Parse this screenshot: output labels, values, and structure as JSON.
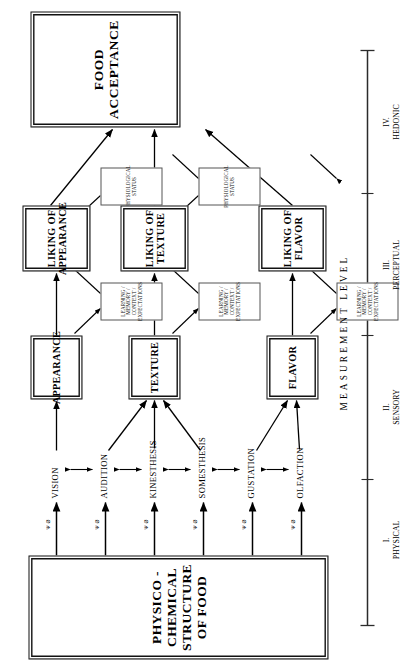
{
  "figure": {
    "source_box": {
      "lines": [
        "PHYSICO -",
        "CHEMICAL",
        "STRUCTURE",
        "OF FOOD"
      ],
      "text": "PHYSICO - CHEMICAL STRUCTURE OF FOOD"
    },
    "acceptance_box": {
      "lines": [
        "FOOD",
        "ACCEPTANCE"
      ],
      "text": "FOOD ACCEPTANCE"
    },
    "senses": [
      {
        "id": "vision",
        "label": "VISION"
      },
      {
        "id": "audition",
        "label": "AUDITION"
      },
      {
        "id": "kinesthesis",
        "label": "KINESTHESIS"
      },
      {
        "id": "somesthesis",
        "label": "SOMESTHESIS"
      },
      {
        "id": "gustation",
        "label": "GUSTATION"
      },
      {
        "id": "olfaction",
        "label": "OLFACTION"
      }
    ],
    "transduction_symbols": [
      {
        "id": "vision-symbol",
        "text": "Ψ Ø"
      },
      {
        "id": "audition-symbol",
        "text": "Ψ Ø"
      },
      {
        "id": "kinesthesis-symbol",
        "text": "Ψ Ø"
      },
      {
        "id": "somesthesis-symbol",
        "text": "Ψ Ø"
      },
      {
        "id": "gustation-symbol",
        "text": "Ψ Ø"
      },
      {
        "id": "olfaction-symbol",
        "text": "Ψ Ø"
      }
    ],
    "perceptual_boxes": [
      {
        "id": "appearance",
        "label": "APPEARANCE"
      },
      {
        "id": "texture",
        "label": "TEXTURE"
      },
      {
        "id": "flavor",
        "label": "FLAVOR"
      }
    ],
    "hedonic_boxes": [
      {
        "id": "liking-appearance",
        "lines": [
          "LIKING OF",
          "APPEARANCE"
        ],
        "text": "LIKING OF APPEARANCE"
      },
      {
        "id": "liking-texture",
        "lines": [
          "LIKING OF",
          "TEXTURE"
        ],
        "text": "LIKING OF TEXTURE"
      },
      {
        "id": "liking-flavor",
        "lines": [
          "LIKING OF",
          "FLAVOR"
        ],
        "text": "LIKING OF FLAVOR"
      }
    ],
    "modifier_boxes": [
      {
        "id": "learning-appearance",
        "lines": [
          "LEARNING / MEMORY /",
          "CONTEXT / EXPECTATIONS"
        ],
        "text": "LEARNING / MEMORY / CONTEXT / EXPECTATIONS"
      },
      {
        "id": "learning-texture",
        "lines": [
          "LEARNING / MEMORY /",
          "CONTEXT / EXPECTATIONS"
        ],
        "text": "LEARNING / MEMORY / CONTEXT / EXPECTATIONS"
      },
      {
        "id": "learning-flavor",
        "lines": [
          "LEARNING / MEMORY /",
          "CONTEXT / EXPECTATIONS"
        ],
        "text": "LEARNING / MEMORY / CONTEXT / EXPECTATIONS"
      },
      {
        "id": "physiological-appearance",
        "lines": [
          "PHYSIOLOGICAL",
          "STATUS"
        ],
        "text": "PHYSIOLOGICAL STATUS"
      },
      {
        "id": "physiological-texture",
        "lines": [
          "PHYSIOLOGICAL",
          "STATUS"
        ],
        "text": "PHYSIOLOGICAL STATUS"
      }
    ],
    "scale": {
      "title": "MEASUREMENT  LEVEL",
      "levels": [
        {
          "id": "level-i",
          "numeral": "I.",
          "name": "PHYSICAL"
        },
        {
          "id": "level-ii",
          "numeral": "II.",
          "name": "SENSORY"
        },
        {
          "id": "level-iii",
          "numeral": "III.",
          "name": "PERCEPTUAL"
        },
        {
          "id": "level-iv",
          "numeral": "IV.",
          "name": "HEDONIC"
        }
      ]
    },
    "colors": {
      "ink": "#000000",
      "paper": "#ffffff",
      "thin_rule": "#555555"
    }
  }
}
